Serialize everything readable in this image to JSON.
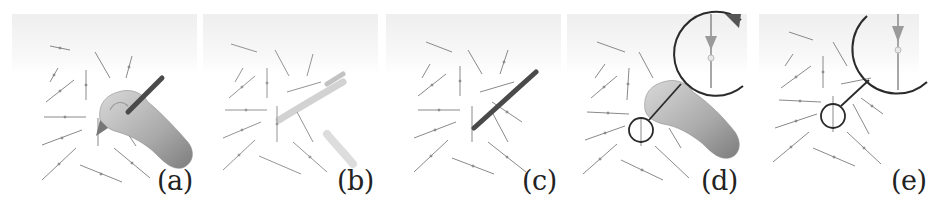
{
  "figure": {
    "panels": [
      {
        "id": "a",
        "label": "(a)",
        "content": "hand-with-stylus-over-vector-field"
      },
      {
        "id": "b",
        "label": "(b)",
        "content": "faded-hand-stylus-trace-over-vector-field"
      },
      {
        "id": "c",
        "label": "(c)",
        "content": "stylus-only-over-vector-field"
      },
      {
        "id": "d",
        "label": "(d)",
        "content": "hand-with-magnifier-inset-over-vector-field"
      },
      {
        "id": "e",
        "label": "(e)",
        "content": "magnifier-inset-over-vector-field"
      }
    ],
    "colors": {
      "arrow": "#8a8a8a",
      "stylus": "#4a4a4a",
      "hand": "#b8b8b8",
      "magnifier": "#2a2a2a",
      "label": "#222222"
    }
  }
}
